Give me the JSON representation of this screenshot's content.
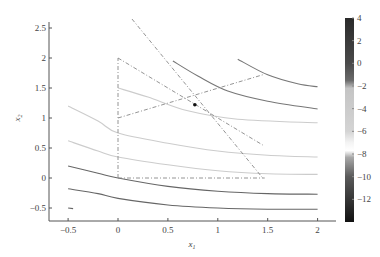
{
  "chart_data": {
    "type": "contour",
    "title": "",
    "xlabel": "x1",
    "ylabel": "x2",
    "xlim": [
      -0.68,
      2.18
    ],
    "ylim": [
      -0.72,
      2.65
    ],
    "xticks": [
      -0.5,
      0,
      0.5,
      1,
      1.5,
      2
    ],
    "xtick_labels": [
      "-0.5",
      "0",
      "0.5",
      "1",
      "1.5",
      "2"
    ],
    "yticks": [
      -0.5,
      0,
      0.5,
      1,
      1.5,
      2,
      2.5
    ],
    "ytick_labels": [
      "-0.5",
      "0",
      "0.5",
      "1",
      "1.5",
      "2",
      "2.5"
    ],
    "grid": false,
    "colorbar": {
      "range": [
        -14,
        4
      ],
      "ticks": [
        4,
        2,
        0,
        -2,
        -4,
        -6,
        -8,
        -10,
        -12
      ],
      "tick_labels": [
        "4",
        "2",
        "0",
        "-2",
        "-4",
        "-6",
        "-8",
        "-10",
        "-12"
      ],
      "stops": [
        {
          "v": 4,
          "color": "#2a2a2a"
        },
        {
          "v": 0,
          "color": "#4a4a4a"
        },
        {
          "v": -1.5,
          "color": "#6a6a6a"
        },
        {
          "v": -2.2,
          "color": "#c4c4c4"
        },
        {
          "v": -6,
          "color": "#d4d4d4"
        },
        {
          "v": -7,
          "color": "#f4f4f4"
        },
        {
          "v": -7.7,
          "color": "#ffffff"
        },
        {
          "v": -8.3,
          "color": "#a8a8a8"
        },
        {
          "v": -10,
          "color": "#5a5a5a"
        },
        {
          "v": -14,
          "color": "#111111"
        }
      ]
    },
    "contours": [
      {
        "color": "#777777",
        "points": [
          [
            1.2,
            1.98
          ],
          [
            1.5,
            1.72
          ],
          [
            1.8,
            1.57
          ],
          [
            2.0,
            1.52
          ]
        ]
      },
      {
        "color": "#777777",
        "points": [
          [
            0.55,
            1.95
          ],
          [
            0.8,
            1.7
          ],
          [
            1.1,
            1.45
          ],
          [
            1.5,
            1.28
          ],
          [
            2.0,
            1.15
          ]
        ]
      },
      {
        "color": "#cccccc",
        "points": [
          [
            0.0,
            1.5
          ],
          [
            0.3,
            1.35
          ],
          [
            0.7,
            1.12
          ],
          [
            1.2,
            0.98
          ],
          [
            2.0,
            0.92
          ]
        ]
      },
      {
        "color": "#cccccc",
        "points": [
          [
            -0.5,
            1.2
          ],
          [
            -0.2,
            0.95
          ],
          [
            0.0,
            0.75
          ],
          [
            0.5,
            0.58
          ],
          [
            1.0,
            0.45
          ],
          [
            1.5,
            0.38
          ],
          [
            2.0,
            0.35
          ]
        ]
      },
      {
        "color": "#cccccc",
        "points": [
          [
            -0.5,
            0.62
          ],
          [
            -0.2,
            0.45
          ],
          [
            0.0,
            0.35
          ],
          [
            0.5,
            0.22
          ],
          [
            1.0,
            0.12
          ],
          [
            1.5,
            0.07
          ],
          [
            2.0,
            0.06
          ]
        ]
      },
      {
        "color": "#666666",
        "points": [
          [
            -0.5,
            0.2
          ],
          [
            -0.2,
            0.08
          ],
          [
            0.0,
            0.0
          ],
          [
            0.5,
            -0.14
          ],
          [
            1.0,
            -0.22
          ],
          [
            1.5,
            -0.26
          ],
          [
            2.0,
            -0.27
          ]
        ]
      },
      {
        "color": "#666666",
        "points": [
          [
            -0.5,
            -0.18
          ],
          [
            -0.2,
            -0.26
          ],
          [
            0.0,
            -0.34
          ],
          [
            0.5,
            -0.45
          ],
          [
            1.0,
            -0.5
          ],
          [
            1.5,
            -0.52
          ],
          [
            2.0,
            -0.52
          ]
        ]
      },
      {
        "color": "#666666",
        "points": [
          [
            -0.5,
            -0.5
          ],
          [
            -0.45,
            -0.51
          ]
        ]
      }
    ],
    "dashed_lines": [
      {
        "points": [
          [
            0.0,
            0.0
          ],
          [
            0.0,
            2.0
          ]
        ]
      },
      {
        "points": [
          [
            0.0,
            0.0
          ],
          [
            1.47,
            0.0
          ]
        ]
      },
      {
        "points": [
          [
            0.0,
            2.0
          ],
          [
            1.45,
            0.55
          ]
        ]
      },
      {
        "points": [
          [
            0.0,
            1.0
          ],
          [
            1.45,
            1.72
          ]
        ]
      },
      {
        "points": [
          [
            0.14,
            2.65
          ],
          [
            1.45,
            0.0
          ]
        ]
      }
    ],
    "points": [
      {
        "label": "optimum",
        "x": 0.77,
        "y": 1.22
      }
    ]
  }
}
